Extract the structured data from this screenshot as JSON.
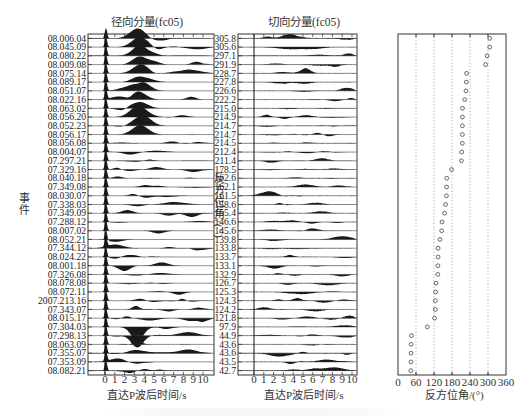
{
  "chart_data": [
    {
      "type": "waveform-section",
      "title": "径向分量(fc05)",
      "xlabel": "直达P波后时间/s",
      "ylabel": "事件",
      "xlim": [
        0,
        10
      ],
      "xticks": [
        "0",
        "1",
        "2",
        "3",
        "4",
        "5",
        "6",
        "7",
        "8",
        "9",
        "10"
      ],
      "events": [
        "08.006.04",
        "08.045.09",
        "08.080.22",
        "08.009.08",
        "08.075.14",
        "08.089.17",
        "08.051.07",
        "08.022.16",
        "08.063.02",
        "08.056.20",
        "08.052.23",
        "08.056.17",
        "08.056.08",
        "08.004.07",
        "07.297.21",
        "07.329.16",
        "08.040.18",
        "07.349.08",
        "08.030.07",
        "07.338.03",
        "07.349.09",
        "07.288.12",
        "08.007.02",
        "08.052.21",
        "07.344.12",
        "08.024.22",
        "08.001.18",
        "07.326.08",
        "08.078.08",
        "08.072.11",
        "2007.213.16",
        "07.343.07",
        "08.015.17",
        "07.304.03",
        "07.298.13",
        "08.063.09",
        "07.355.07",
        "07.353.09",
        "08.082.21"
      ]
    },
    {
      "type": "waveform-section",
      "title": "切向分量(fc05)",
      "xlabel": "直达P波后时间/s",
      "ylabel": "反方位角/(°)",
      "xlim": [
        0,
        10
      ],
      "xticks": [
        "0",
        "1",
        "2",
        "3",
        "4",
        "5",
        "6",
        "7",
        "8",
        "9",
        "10"
      ],
      "back_azimuths": [
        "305.8",
        "305.6",
        "297.1",
        "291.9",
        "228.7",
        "227.8",
        "226.6",
        "222.2",
        "215.0",
        "214.9",
        "214.7",
        "214.7",
        "214.5",
        "212.4",
        "211.4",
        "178.5",
        "162.6",
        "162.1",
        "161.5",
        "158.6",
        "155.4",
        "146.6",
        "145.6",
        "139.8",
        "133.8",
        "133.7",
        "133.1",
        "132.9",
        "126.7",
        "125.3",
        "124.3",
        "124.2",
        "121.8",
        "97.9",
        "44.9",
        "43.6",
        "43.6",
        "43.5",
        "42.7"
      ]
    },
    {
      "type": "scatter",
      "title": "",
      "xlabel": "反方位角/(°)",
      "ylabel": "",
      "xlim": [
        0,
        360
      ],
      "xticks": [
        "0",
        "60",
        "120",
        "180",
        "240",
        "300",
        "360"
      ],
      "grid": "vertical dotted at 60,120,180,240,300",
      "marker": "open circle",
      "x": [
        305.8,
        305.6,
        297.1,
        291.9,
        228.7,
        227.8,
        226.6,
        222.2,
        215.0,
        214.9,
        214.7,
        214.7,
        214.5,
        212.4,
        211.4,
        178.5,
        162.6,
        162.1,
        161.5,
        158.6,
        155.4,
        146.6,
        145.6,
        139.8,
        133.8,
        133.7,
        133.1,
        132.9,
        126.7,
        125.3,
        124.3,
        124.2,
        121.8,
        97.9,
        44.9,
        43.6,
        43.6,
        43.5,
        42.7
      ]
    }
  ],
  "panels": {
    "radial": {
      "title": "径向分量(fc05)",
      "xlabel": "直达P波后时间/s",
      "ylabel": "事件"
    },
    "transverse": {
      "title": "切向分量(fc05)",
      "xlabel": "直达P波后时间/s",
      "ylabel": "反方位角/(°)"
    },
    "baz": {
      "xlabel": "反方位角/(°)"
    }
  },
  "colors": {
    "trace_fill": "#1a1a1a",
    "frame": "#333333",
    "grid": "#888888"
  }
}
